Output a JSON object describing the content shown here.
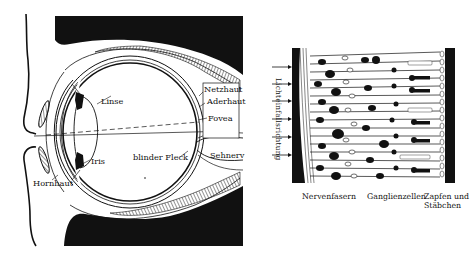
{
  "figure": {
    "eye_diagram": {
      "labels": {
        "lens": "Linse",
        "iris": "Iris",
        "cornea": "Hornhaut",
        "retina": "Netzhaut",
        "choroid": "Aderhaut",
        "fovea": "Fovea",
        "blind_spot": "blinder Fleck",
        "optic_nerve": "Sehnerv"
      }
    },
    "retina_diagram": {
      "light_direction_label": "Lichteinfallsrichtung",
      "arrow_count": 6,
      "layer_labels": [
        {
          "id": "nerve-fibers",
          "text": "Nervenfasern"
        },
        {
          "id": "ganglion-cells",
          "text": "Ganglienzellen"
        },
        {
          "id": "cones-rods",
          "line1": "Zapfen und",
          "line2": "Stäbchen"
        }
      ]
    },
    "colors": {
      "ink": "#111111",
      "paper": "#ffffff"
    }
  }
}
